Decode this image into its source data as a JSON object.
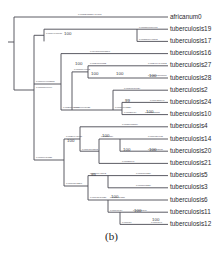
{
  "figure": {
    "caption": "(b)",
    "type": "phylogenetic-tree",
    "style": "rectangular-cladogram",
    "line_color": "#4a4a52",
    "text_color": "#2a2a2f"
  },
  "tips": [
    {
      "label": "africanum0",
      "y": 17,
      "x_start": 44,
      "branch_length": "0.07112733884414171"
    },
    {
      "label": "tuberculosis19",
      "y": 29.2,
      "x_start": 137,
      "branch_length": "0.0008170954961"
    },
    {
      "label": "tuberculosis17",
      "y": 41.4,
      "x_start": 137,
      "branch_length": "0.0011866440868"
    },
    {
      "label": "tuberculosis16",
      "y": 53.6,
      "x_start": 88,
      "branch_length": "0.00410000098867"
    },
    {
      "label": "tuberculosis27",
      "y": 65.8,
      "x_start": 146,
      "branch_length": "0.0024904146302"
    },
    {
      "label": "tuberculosis28",
      "y": 78.0,
      "x_start": 146,
      "branch_length": "0.0028003907607"
    },
    {
      "label": "tuberculosis2",
      "y": 90.2,
      "x_start": 122,
      "branch_length": "0.00390019624"
    },
    {
      "label": "tuberculosis24",
      "y": 102.4,
      "x_start": 148,
      "branch_length": "0.0014211949"
    },
    {
      "label": "tuberculosis10",
      "y": 114.6,
      "x_start": 143,
      "branch_length": "0.0018023087"
    },
    {
      "label": "tuberculosis4",
      "y": 126.8,
      "x_start": 120,
      "branch_length": "0.00116178684"
    },
    {
      "label": "tuberculosis14",
      "y": 139.0,
      "x_start": 146,
      "branch_length": "0.0009384938"
    },
    {
      "label": "tuberculosis20",
      "y": 151.2,
      "x_start": 146,
      "branch_length": "0.0012008937"
    },
    {
      "label": "tuberculosis21",
      "y": 163.4,
      "x_start": 120,
      "branch_length": "0.00121840"
    },
    {
      "label": "tuberculosis5",
      "y": 175.6,
      "x_start": 134,
      "branch_length": "0.0016100824"
    },
    {
      "label": "tuberculosis3",
      "y": 187.8,
      "x_start": 134,
      "branch_length": "0.0013908824"
    },
    {
      "label": "tuberculosis6",
      "y": 200.0,
      "x_start": 108,
      "branch_length": "0.0018424880"
    },
    {
      "label": "tuberculosis11",
      "y": 212.2,
      "x_start": 131,
      "branch_length": "0.001620840"
    },
    {
      "label": "tuberculosis12",
      "y": 224.4,
      "x_start": 149,
      "branch_length": "0.0009840"
    }
  ],
  "nodes": [
    {
      "id": "root",
      "x": 14,
      "support": null
    },
    {
      "id": "n1",
      "x": 44,
      "support": null,
      "branch_length": "0.00000099999"
    },
    {
      "id": "n2",
      "x": 61,
      "support": "100",
      "branch_length": "0.0009999968537"
    },
    {
      "id": "n3",
      "x": 137,
      "support": "100",
      "branch_length": "0.00194900937"
    },
    {
      "id": "n4",
      "x": 72,
      "support": "100",
      "branch_length": "0.00207909840"
    },
    {
      "id": "n5",
      "x": 88,
      "support": "100",
      "branch_length": "0.00100999842"
    },
    {
      "id": "n6",
      "x": 113,
      "support": "100",
      "branch_length": "0.00240009832"
    },
    {
      "id": "n7",
      "x": 146,
      "support": "100",
      "branch_length": "0.00199098425"
    },
    {
      "id": "n8",
      "x": 122,
      "support": "99",
      "branch_length": "0.00104098224"
    },
    {
      "id": "n9",
      "x": 143,
      "support": "100",
      "branch_length": "0.00120984"
    },
    {
      "id": "n10",
      "x": 64,
      "support": "100",
      "branch_length": "0.00109984821"
    },
    {
      "id": "n11",
      "x": 99,
      "support": "100",
      "branch_length": "0.00204948421"
    },
    {
      "id": "n12",
      "x": 120,
      "support": "100",
      "branch_length": "0.00141098845"
    },
    {
      "id": "n13",
      "x": 146,
      "support": "100",
      "branch_length": "0.00119834"
    },
    {
      "id": "n14",
      "x": 88,
      "support": "95",
      "branch_length": "0.00190848297"
    },
    {
      "id": "n15",
      "x": 108,
      "support": "100",
      "branch_length": "0.00160948342"
    },
    {
      "id": "n16",
      "x": 120,
      "support": "100",
      "branch_length": "0.00148984023"
    },
    {
      "id": "n17",
      "x": 131,
      "support": "100",
      "branch_length": "0.00140984"
    },
    {
      "id": "n18",
      "x": 149,
      "support": "100",
      "branch_length": "0.000984"
    }
  ],
  "bootstrap_labels": [
    {
      "value": "100",
      "x": 64,
      "y": 32
    },
    {
      "value": "100",
      "x": 75,
      "y": 62
    },
    {
      "value": "100",
      "x": 91,
      "y": 72
    },
    {
      "value": "100",
      "x": 116,
      "y": 72
    },
    {
      "value": "100",
      "x": 149,
      "y": 74
    },
    {
      "value": "99",
      "x": 125,
      "y": 99
    },
    {
      "value": "100",
      "x": 146,
      "y": 110
    },
    {
      "value": "100",
      "x": 67,
      "y": 139
    },
    {
      "value": "100",
      "x": 102,
      "y": 134
    },
    {
      "value": "100",
      "x": 123,
      "y": 148
    },
    {
      "value": "100",
      "x": 149,
      "y": 148
    },
    {
      "value": "95",
      "x": 91,
      "y": 173
    },
    {
      "value": "100",
      "x": 111,
      "y": 195
    },
    {
      "value": "100",
      "x": 134,
      "y": 209
    },
    {
      "value": "100",
      "x": 152,
      "y": 218
    }
  ]
}
